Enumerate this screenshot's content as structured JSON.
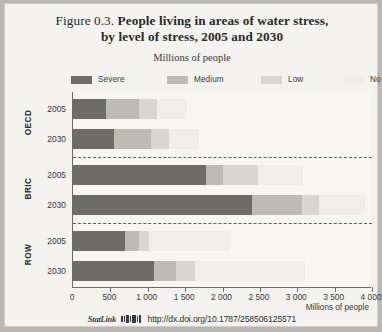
{
  "figure": {
    "number": "Figure 0.3.",
    "title_line1": "People living in areas of water stress,",
    "title_line2": "by level of stress, 2005 and 2030",
    "subtitle": "Millions of people",
    "axis_title": "Millions of people"
  },
  "statlink": {
    "word": "StatLink",
    "icon": "statlink-barcode-icon",
    "url": "http://dx.doi.org/10.1787/258506125571"
  },
  "colors": {
    "severe": "#6e6c68",
    "medium": "#bdbbb6",
    "low": "#d8d6d2",
    "no": "#efeeec",
    "axis": "#6d6b67",
    "separator": "#5d5b57",
    "plot_background": "#f7f6f3",
    "page_background": "#f4f3f0"
  },
  "chart_data": {
    "type": "bar",
    "orientation": "horizontal",
    "stacked": true,
    "title": "People living in areas of water stress, by level of stress, 2005 and 2030",
    "subtitle": "Millions of people",
    "xlabel": "Millions of people",
    "ylabel": "",
    "xlim": [
      0,
      4000
    ],
    "xticks": [
      0,
      500,
      1000,
      1500,
      2000,
      2500,
      3000,
      3500,
      4000
    ],
    "xtick_labels": [
      "0",
      "500",
      "1 000",
      "1 500",
      "2 000",
      "2 500",
      "3 000",
      "3 500",
      "4 000"
    ],
    "grid": false,
    "legend_position": "top",
    "legend": [
      "Severe",
      "Medium",
      "Low",
      "No"
    ],
    "groups": [
      {
        "name": "OECD",
        "rows": [
          {
            "year": "2005",
            "values": {
              "severe": 440,
              "medium": 440,
              "low": 240,
              "no": 400
            }
          },
          {
            "year": "2030",
            "values": {
              "severe": 550,
              "medium": 495,
              "low": 240,
              "no": 400
            }
          }
        ]
      },
      {
        "name": "BRIC",
        "rows": [
          {
            "year": "2005",
            "values": {
              "severe": 1780,
              "medium": 230,
              "low": 465,
              "no": 600
            }
          },
          {
            "year": "2030",
            "values": {
              "severe": 2395,
              "medium": 670,
              "low": 225,
              "no": 610
            }
          }
        ]
      },
      {
        "name": "ROW",
        "rows": [
          {
            "year": "2005",
            "values": {
              "severe": 695,
              "medium": 185,
              "low": 135,
              "no": 1080
            }
          },
          {
            "year": "2030",
            "values": {
              "severe": 1085,
              "medium": 295,
              "low": 250,
              "no": 1480
            }
          }
        ]
      }
    ],
    "series": [
      {
        "name": "Severe",
        "values": [
          440,
          550,
          1780,
          2395,
          695,
          1085
        ]
      },
      {
        "name": "Medium",
        "values": [
          440,
          495,
          230,
          670,
          185,
          295
        ]
      },
      {
        "name": "Low",
        "values": [
          240,
          240,
          465,
          225,
          135,
          250
        ]
      },
      {
        "name": "No",
        "values": [
          400,
          400,
          600,
          610,
          1080,
          1480
        ]
      }
    ],
    "categories": [
      "OECD 2005",
      "OECD 2030",
      "BRIC 2005",
      "BRIC 2030",
      "ROW 2005",
      "ROW 2030"
    ]
  }
}
